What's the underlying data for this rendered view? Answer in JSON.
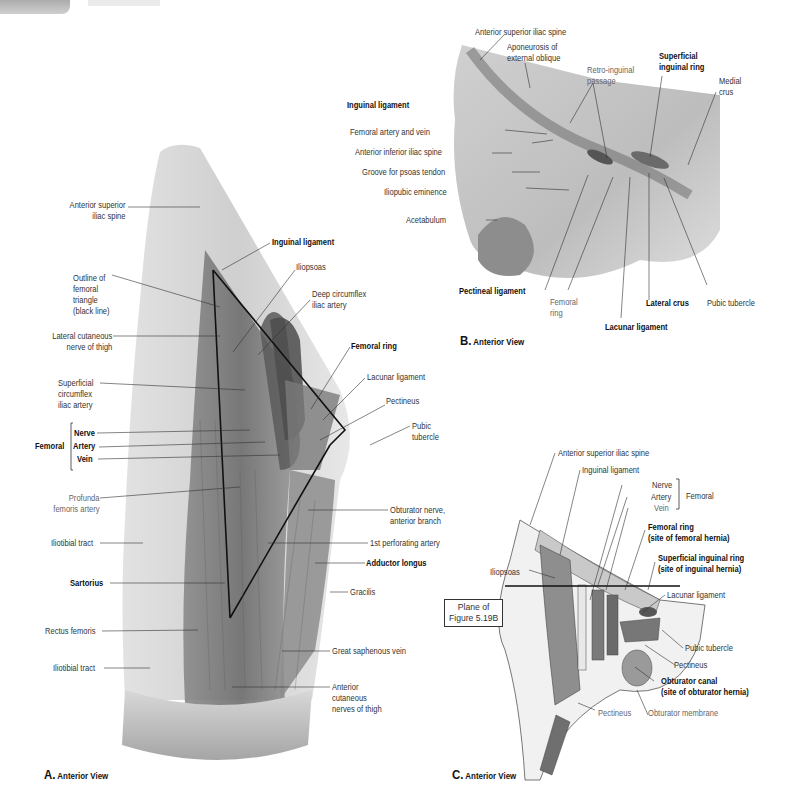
{
  "page_header": {
    "tab": "",
    "running_title": ""
  },
  "figure_A": {
    "caption_letter": "A.",
    "caption_text": "Anterior View",
    "labels": {
      "asis": "Anterior superior\niliac spine",
      "outline": "Outline of\nfemoral\ntriangle\n(black line)",
      "lat_cut_nerve": "Lateral cutaneous\nnerve of thigh",
      "sup_circ": "Superficial\ncircumflex\niliac artery",
      "femoral_group": "Femoral",
      "nerve": "Nerve",
      "artery": "Artery",
      "vein": "Vein",
      "profunda": "Profunda\nfemoris artery",
      "iliotibial1": "Iliotibial tract",
      "sartorius": "Sartorius",
      "rectus": "Rectus femoris",
      "iliotibial2": "Iliotibial tract",
      "inguinal_lig": "Inguinal ligament",
      "iliopsoas": "Iliopsoas",
      "deep_circ": "Deep circumflex\niliac artery",
      "femoral_ring": "Femoral ring",
      "lacunar": "Lacunar ligament",
      "pectineus": "Pectineus",
      "pubic_tub": "Pubic\ntubercle",
      "obturator": "Obturator nerve,\nanterior branch",
      "perforating": "1st perforating artery",
      "adductor": "Adductor longus",
      "gracilis": "Gracilis",
      "saphenous": "Great saphenous vein",
      "ant_cut": "Anterior\ncutaneous\nnerves of thigh"
    }
  },
  "figure_B": {
    "caption_letter": "B.",
    "caption_text": "Anterior View",
    "labels": {
      "asis": "Anterior superior iliac spine",
      "aponeurosis": "Aponeurosis of\nexternal oblique",
      "retro": "Retro-inguinal\npassage",
      "sup_ring": "Superficial\ninguinal ring",
      "medial_crus": "Medial\ncrus",
      "inguinal_lig": "Inguinal ligament",
      "fem_art_vein": "Femoral artery and vein",
      "aiis": "Anterior inferior iliac spine",
      "groove": "Groove for psoas tendon",
      "iliopubic": "Iliopubic eminence",
      "acetabulum": "Acetabulum",
      "pectineal": "Pectineal ligament",
      "femoral_ring": "Femoral\nring",
      "lacunar": "Lacunar ligament",
      "lateral_crus": "Lateral crus",
      "pubic_tub": "Pubic tubercle"
    }
  },
  "figure_C": {
    "caption_letter": "C.",
    "caption_text": "Anterior View",
    "labels": {
      "asis": "Anterior superior iliac spine",
      "inguinal_lig": "Inguinal ligament",
      "nerve": "Nerve",
      "artery": "Artery",
      "vein": "Vein",
      "femoral_group": "Femoral",
      "femoral_ring": "Femoral ring\n(site of femoral hernia)",
      "sup_ring": "Superficial inguinal ring\n(site of inguinal hernia)",
      "iliopsoas": "Iliopsoas",
      "lacunar": "Lacunar ligament",
      "plane": "Plane of\nFigure 5.19B",
      "pubic_tub": "Pubic tubercle",
      "pectineus1": "Pectineus",
      "obt_canal": "Obturator canal\n(site of obturator hernia)",
      "obt_membrane": "Obturator membrane",
      "pectineus2": "Pectineus"
    }
  },
  "colors": {
    "ink": "#111111",
    "label": "#333333",
    "light_label": "#777777",
    "tissue": "#b8b8b8"
  }
}
